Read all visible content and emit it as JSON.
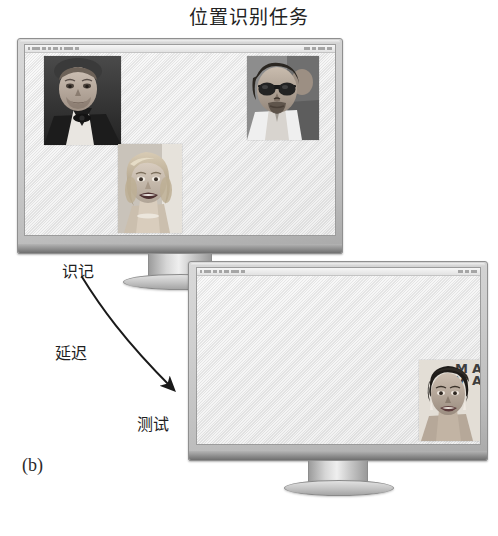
{
  "figure": {
    "title": "位置识别任务",
    "panel_letter": "(b)"
  },
  "steps": {
    "encoding_label": "识记",
    "delay_label": "延迟",
    "test_label": "测试"
  },
  "monitors": [
    {
      "name": "encoding-monitor",
      "faces": [
        {
          "id": "face-top-left",
          "description": "man-bowtie-tuxedo-face"
        },
        {
          "id": "face-top-right",
          "description": "man-sunglasses-goatee-face"
        },
        {
          "id": "face-bottom-center",
          "description": "blonde-woman-smiling-face"
        }
      ]
    },
    {
      "name": "test-monitor",
      "faces": [
        {
          "id": "face-right",
          "description": "short-dark-hair-woman-face"
        }
      ]
    }
  ],
  "colors": {
    "background": "#ffffff",
    "bezel": "#cfcfcf",
    "screen": "#eaeaea",
    "arrow": "#1a1a1a",
    "text": "#1f1f1f"
  }
}
